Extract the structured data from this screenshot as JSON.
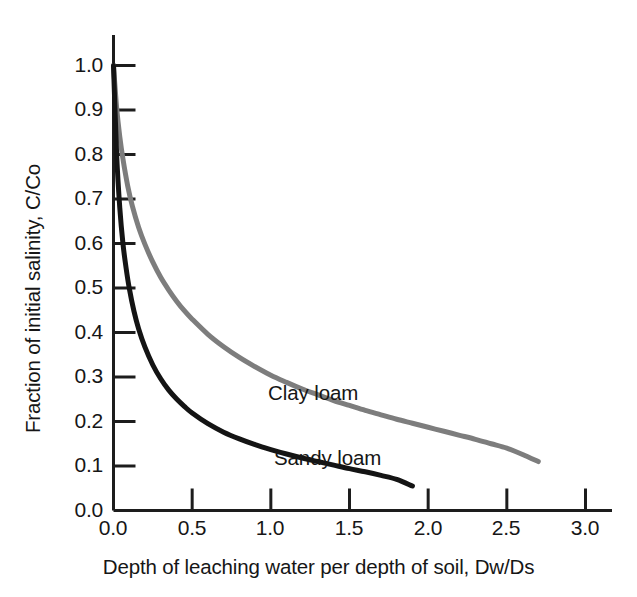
{
  "chart_data": {
    "type": "line",
    "title": "",
    "subtitle": "",
    "xlabel": "Depth of leaching water per depth of soil, Dw/Ds",
    "ylabel": "Fraction of initial salinity, C/Co",
    "xlim": [
      0.0,
      3.0
    ],
    "ylim": [
      0.0,
      1.0
    ],
    "xticks": [
      "0.0",
      "0.5",
      "1.0",
      "1.5",
      "2.0",
      "2.5",
      "3.0"
    ],
    "xtick_values": [
      0.0,
      0.5,
      1.0,
      1.5,
      2.0,
      2.5,
      3.0
    ],
    "yticks": [
      "0.0",
      "0.1",
      "0.2",
      "0.3",
      "0.4",
      "0.5",
      "0.6",
      "0.7",
      "0.8",
      "0.9",
      "1.0"
    ],
    "ytick_values": [
      0.0,
      0.1,
      0.2,
      0.3,
      0.4,
      0.5,
      0.6,
      0.7,
      0.8,
      0.9,
      1.0
    ],
    "grid": false,
    "legend_position": "inline-annotation",
    "tick_direction": "in",
    "spines": [
      "left",
      "bottom"
    ],
    "series": [
      {
        "name": "Clay loam",
        "color": "#7d7d7d",
        "line_width": 5,
        "annotation": "Clay loam",
        "x": [
          0.0,
          0.02,
          0.04,
          0.06,
          0.09,
          0.12,
          0.16,
          0.2,
          0.25,
          0.3,
          0.35,
          0.4,
          0.45,
          0.5,
          0.6,
          0.7,
          0.8,
          0.9,
          1.0,
          1.1,
          1.2,
          1.3,
          1.4,
          1.5,
          1.6,
          1.7,
          1.8,
          1.9,
          2.0,
          2.1,
          2.2,
          2.3,
          2.4,
          2.5,
          2.6,
          2.7
        ],
        "y": [
          1.0,
          0.905,
          0.84,
          0.79,
          0.73,
          0.684,
          0.636,
          0.598,
          0.558,
          0.524,
          0.496,
          0.471,
          0.449,
          0.43,
          0.396,
          0.368,
          0.344,
          0.323,
          0.304,
          0.288,
          0.273,
          0.26,
          0.247,
          0.236,
          0.225,
          0.215,
          0.205,
          0.196,
          0.187,
          0.178,
          0.169,
          0.16,
          0.15,
          0.14,
          0.126,
          0.11
        ]
      },
      {
        "name": "Sandy loam",
        "color": "#141414",
        "line_width": 5,
        "annotation": "Sandy loam",
        "x": [
          0.0,
          0.02,
          0.04,
          0.06,
          0.08,
          0.1,
          0.13,
          0.16,
          0.2,
          0.25,
          0.3,
          0.35,
          0.4,
          0.45,
          0.5,
          0.6,
          0.7,
          0.8,
          0.9,
          1.0,
          1.1,
          1.2,
          1.3,
          1.4,
          1.5,
          1.6,
          1.7,
          1.8,
          1.9
        ],
        "y": [
          1.0,
          0.8,
          0.68,
          0.6,
          0.545,
          0.5,
          0.448,
          0.408,
          0.367,
          0.327,
          0.296,
          0.271,
          0.251,
          0.234,
          0.219,
          0.195,
          0.176,
          0.161,
          0.148,
          0.137,
          0.127,
          0.118,
          0.11,
          0.102,
          0.094,
          0.087,
          0.079,
          0.07,
          0.055
        ]
      }
    ],
    "annotations": [
      {
        "text": "Clay loam",
        "x": 1.0,
        "y": 0.295,
        "color": "#161616"
      },
      {
        "text": "Sandy loam",
        "x": 1.05,
        "y": 0.15,
        "color": "#161616"
      }
    ]
  },
  "axes": {
    "axis_color": "#1d1d1d",
    "background": "#ffffff"
  }
}
